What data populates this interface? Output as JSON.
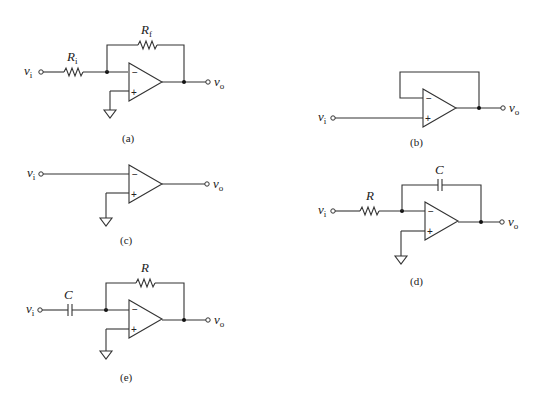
{
  "figure": {
    "circuits": [
      {
        "id": "a",
        "caption": "(a)",
        "input_label": "v",
        "input_sub": "i",
        "output_label": "v",
        "output_sub": "o",
        "components": [
          {
            "type": "resistor",
            "label": "R",
            "sub": "i",
            "position": "input"
          },
          {
            "type": "resistor",
            "label": "R",
            "sub": "f",
            "position": "feedback"
          }
        ],
        "non_inverting_input": "ground",
        "inverting_sign": "−",
        "non_inverting_sign": "+"
      },
      {
        "id": "b",
        "caption": "(b)",
        "input_label": "v",
        "input_sub": "i",
        "output_label": "v",
        "output_sub": "o",
        "components": [
          {
            "type": "wire",
            "label": "",
            "sub": "",
            "position": "feedback"
          }
        ],
        "non_inverting_input": "v_i",
        "inverting_sign": "−",
        "non_inverting_sign": "+"
      },
      {
        "id": "c",
        "caption": "(c)",
        "input_label": "v",
        "input_sub": "i",
        "output_label": "v",
        "output_sub": "o",
        "components": [],
        "non_inverting_input": "ground",
        "inverting_sign": "−",
        "non_inverting_sign": "+"
      },
      {
        "id": "d",
        "caption": "(d)",
        "input_label": "v",
        "input_sub": "i",
        "output_label": "v",
        "output_sub": "o",
        "components": [
          {
            "type": "resistor",
            "label": "R",
            "sub": "",
            "position": "input"
          },
          {
            "type": "capacitor",
            "label": "C",
            "sub": "",
            "position": "feedback"
          }
        ],
        "non_inverting_input": "ground",
        "inverting_sign": "−",
        "non_inverting_sign": "+"
      },
      {
        "id": "e",
        "caption": "(e)",
        "input_label": "v",
        "input_sub": "i",
        "output_label": "v",
        "output_sub": "o",
        "components": [
          {
            "type": "capacitor",
            "label": "C",
            "sub": "",
            "position": "input"
          },
          {
            "type": "resistor",
            "label": "R",
            "sub": "",
            "position": "feedback"
          }
        ],
        "non_inverting_input": "ground",
        "inverting_sign": "−",
        "non_inverting_sign": "+"
      }
    ]
  }
}
